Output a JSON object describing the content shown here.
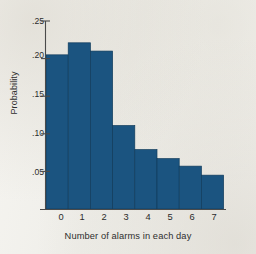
{
  "chart_data": {
    "type": "bar",
    "title": "",
    "subtitle": "",
    "xlabel": "Number of alarms in each day",
    "ylabel": "Probability",
    "categories": [
      "0",
      "1",
      "2",
      "3",
      "4",
      "5",
      "6",
      "7"
    ],
    "values": [
      0.205,
      0.221,
      0.21,
      0.111,
      0.079,
      0.067,
      0.057,
      0.045
    ],
    "series": [
      {
        "name": "Probability",
        "values": [
          0.205,
          0.221,
          0.21,
          0.111,
          0.079,
          0.067,
          0.057,
          0.045
        ]
      }
    ],
    "ylim": [
      0,
      0.25
    ],
    "xlim": [
      -0.5,
      7.5
    ],
    "ytick_labels": [
      ".25",
      ".20",
      ".15",
      ".10",
      ".05"
    ],
    "ytick_values": [
      0.25,
      0.2,
      0.15,
      0.1,
      0.05
    ],
    "xtick_labels": [
      "0",
      "1",
      "2",
      "3",
      "4",
      "5",
      "6",
      "7"
    ],
    "grid": false,
    "legend": "none",
    "bar_color": "#1b5480",
    "bar_edge_color": "#123c5c",
    "axis_color": "#4a4a4a",
    "background_color": "#f4f3ef",
    "annotations": []
  },
  "axis": {
    "ylabel": "Probability",
    "xlabel": "Number of alarms in each day",
    "yticks": [
      {
        "label": ".25",
        "value": 0.25
      },
      {
        "label": ".20",
        "value": 0.2
      },
      {
        "label": ".15",
        "value": 0.15
      },
      {
        "label": ".10",
        "value": 0.1
      },
      {
        "label": ".05",
        "value": 0.05
      }
    ],
    "xticks": [
      {
        "label": "0"
      },
      {
        "label": "1"
      },
      {
        "label": "2"
      },
      {
        "label": "3"
      },
      {
        "label": "4"
      },
      {
        "label": "5"
      },
      {
        "label": "6"
      },
      {
        "label": "7"
      }
    ]
  }
}
